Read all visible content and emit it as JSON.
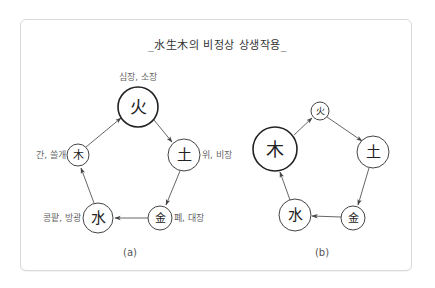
{
  "title": "_水生木의 비정상 상생작용_",
  "colors": {
    "stroke": "#444444",
    "text": "#222222",
    "organ_text": "#666666",
    "panel_border": "#d9d9d9"
  },
  "diagram_a": {
    "label": "(a)",
    "nodes": {
      "fire": {
        "char": "火",
        "organs": "심장, 소장"
      },
      "earth": {
        "char": "土",
        "organs": "위, 비장"
      },
      "metal": {
        "char": "金",
        "organs": "폐, 대장"
      },
      "water": {
        "char": "水",
        "organs": "콩팥, 방광"
      },
      "wood": {
        "char": "木",
        "organs": "간, 쓸개"
      }
    },
    "edges": [
      "木→火",
      "火→土",
      "土→金",
      "金→水",
      "水→木"
    ]
  },
  "diagram_b": {
    "label": "(b)",
    "nodes": {
      "fire": {
        "char": "火"
      },
      "earth": {
        "char": "土"
      },
      "metal": {
        "char": "金"
      },
      "water": {
        "char": "水"
      },
      "wood": {
        "char": "木"
      }
    },
    "edges": [
      "木→火",
      "火→土",
      "土→金",
      "金→水",
      "水→木"
    ]
  }
}
